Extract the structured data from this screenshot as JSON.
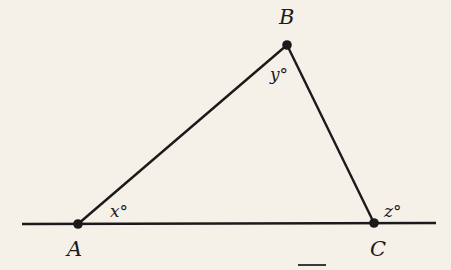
{
  "diagram": {
    "type": "geometry",
    "colors": {
      "background": "#f5f1e8",
      "stroke": "#1a1a1a"
    },
    "line": {
      "x1": 22,
      "y1": 224,
      "x2": 436,
      "y2": 223
    },
    "points": {
      "A": {
        "x": 78,
        "y": 224,
        "label": "A",
        "label_x": 67,
        "label_y": 256
      },
      "B": {
        "x": 287,
        "y": 45,
        "label": "B",
        "label_x": 279,
        "label_y": 24
      },
      "C": {
        "x": 374,
        "y": 223,
        "label": "C",
        "label_x": 370,
        "label_y": 256
      }
    },
    "angles": {
      "x": {
        "label": "x°",
        "at": "A",
        "pos_x": 110,
        "pos_y": 217
      },
      "y": {
        "label": "y°",
        "at": "B",
        "pos_x": 270,
        "pos_y": 80
      },
      "z": {
        "label": "z°",
        "at": "C (exterior)",
        "pos_x": 384,
        "pos_y": 217
      }
    },
    "answer_blank": {
      "x1": 298,
      "y1": 265,
      "x2": 326,
      "y2": 265
    }
  }
}
